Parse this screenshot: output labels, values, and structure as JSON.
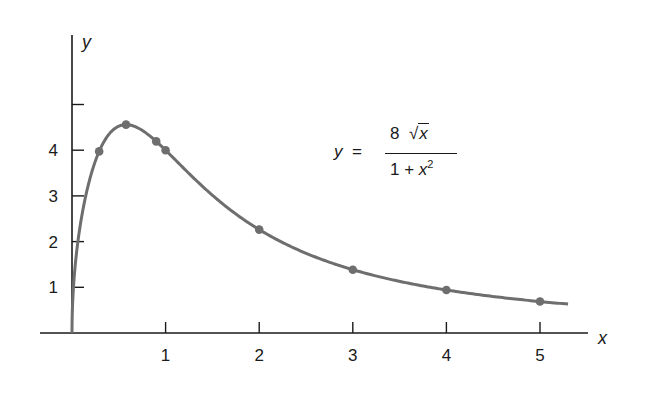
{
  "chart_data": {
    "type": "line",
    "title": "",
    "equation": "y = 8√x / (1 + x²)",
    "xlabel": "x",
    "ylabel": "y",
    "xlim": [
      0,
      5.3
    ],
    "ylim": [
      0,
      5
    ],
    "x_ticks": [
      1,
      2,
      3,
      4,
      5
    ],
    "y_ticks": [
      1,
      2,
      3,
      4,
      5
    ],
    "x_tick_labels": [
      "1",
      "2",
      "3",
      "4",
      "5"
    ],
    "y_tick_labels": [
      "1",
      "2",
      "3",
      "4",
      ""
    ],
    "grid": false,
    "series": [
      {
        "name": "y = 8√x/(1+x²)",
        "color": "#6e6e6e",
        "marked_points": [
          {
            "x": 0.29,
            "y": 4.0
          },
          {
            "x": 0.577,
            "y": 4.56
          },
          {
            "x": 0.9,
            "y": 4.2
          },
          {
            "x": 1,
            "y": 4.0
          },
          {
            "x": 2,
            "y": 2.26
          },
          {
            "x": 3,
            "y": 1.39
          },
          {
            "x": 4,
            "y": 0.94
          },
          {
            "x": 5,
            "y": 0.69
          }
        ]
      }
    ]
  },
  "labels": {
    "x_axis": "x",
    "y_axis": "y",
    "x_ticks": [
      "1",
      "2",
      "3",
      "4",
      "5"
    ],
    "y_ticks": [
      "1",
      "2",
      "3",
      "4"
    ]
  },
  "formula": {
    "lhs": "y",
    "equals": "=",
    "numerator_coef": "8",
    "numerator_var": "x",
    "denominator_const": "1 + ",
    "denominator_var": "x",
    "denominator_exp": "2"
  },
  "colors": {
    "curve": "#6e6e6e",
    "axis": "#1a1a1a",
    "background": "#ffffff"
  }
}
